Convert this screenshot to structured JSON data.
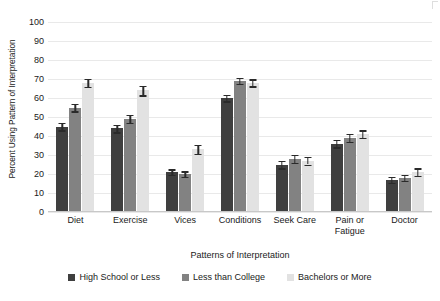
{
  "chart_data": {
    "type": "bar",
    "title": "",
    "xlabel": "Patterns of Interpretation",
    "ylabel": "Percent Using Pattern of Interpretation",
    "ylim": [
      0,
      100
    ],
    "ytick_step": 10,
    "yticks": [
      "100",
      "90",
      "80",
      "70",
      "60",
      "50",
      "40",
      "30",
      "20",
      "10",
      "0"
    ],
    "grid": true,
    "legend_position": "bottom",
    "categories": [
      "Diet",
      "Exercise",
      "Vices",
      "Conditions",
      "Seek Care",
      "Pain or Fatigue",
      "Doctor"
    ],
    "series": [
      {
        "name": "High School or Less",
        "color": "#3f3f3f",
        "values": [
          45,
          44,
          21,
          60,
          25,
          36,
          17
        ],
        "errors": [
          2.0,
          2.0,
          1.5,
          1.8,
          2.0,
          2.0,
          1.5
        ]
      },
      {
        "name": "Less than College",
        "color": "#828282",
        "values": [
          55,
          49,
          20,
          69,
          28,
          39,
          18
        ],
        "errors": [
          2.0,
          2.0,
          1.5,
          1.5,
          2.0,
          2.0,
          1.5
        ]
      },
      {
        "name": "Bachelors or More",
        "color": "#e2e2e2",
        "values": [
          68,
          64,
          33,
          68,
          27,
          41,
          21
        ],
        "errors": [
          2.0,
          2.5,
          2.5,
          1.8,
          2.0,
          2.0,
          2.0
        ]
      }
    ]
  },
  "legend": {
    "items": [
      {
        "label": "High School or Less"
      },
      {
        "label": "Less than College"
      },
      {
        "label": "Bachelors or More"
      }
    ]
  }
}
